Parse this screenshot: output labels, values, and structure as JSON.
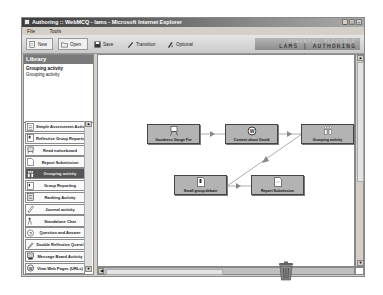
{
  "window": {
    "title": "Authoring :: WebMCQ - lams - Microsoft Internet Explorer",
    "controls": [
      "_",
      "□",
      "×"
    ]
  },
  "menu": {
    "items": [
      "File",
      "Tools"
    ]
  },
  "toolbar": {
    "new_label": "New",
    "open_label": "Open",
    "save_label": "Save",
    "transition_label": "Transition",
    "optional_label": "Optional",
    "brand_text": "LAMS | AUTHORING",
    "brand_ghost": "POWERFUL FLEXIBLE"
  },
  "library": {
    "title": "Library",
    "selected_title": "Grouping activity",
    "selected_desc": "Grouping activity",
    "items": [
      {
        "label": "Simple Assessment Activ",
        "icon": "list-doc-icon"
      },
      {
        "label": "Reflective Group Reports",
        "icon": "report-icon"
      },
      {
        "label": "Read noticeboard",
        "icon": "noticeboard-icon"
      },
      {
        "label": "Report Submission",
        "icon": "submission-icon"
      },
      {
        "label": "Grouping activity",
        "icon": "grouping-icon",
        "selected": true
      },
      {
        "label": "Group Reporting",
        "icon": "group-report-icon"
      },
      {
        "label": "Ranking Activity",
        "icon": "ranking-icon"
      },
      {
        "label": "Journal activity",
        "icon": "journal-icon"
      },
      {
        "label": "Standalone Chat",
        "icon": "chat-icon"
      },
      {
        "label": "Question and Answer",
        "icon": "question-icon"
      },
      {
        "label": "Double Reflective Questi",
        "icon": "pencil-icon"
      },
      {
        "label": "Message Board Activity",
        "icon": "message-board-icon"
      },
      {
        "label": "View Web Pages (URLs)",
        "icon": "web-icon"
      }
    ]
  },
  "canvas": {
    "nodes": [
      {
        "label": "Goodness Gauge For",
        "icon": "gauge-icon",
        "x": 49,
        "y": 69
      },
      {
        "label": "Content about Gould",
        "icon": "web-content-icon",
        "x": 127,
        "y": 69
      },
      {
        "label": "Grouping activity",
        "icon": "grouping-icon",
        "x": 203,
        "y": 69
      },
      {
        "label": "Small group debate",
        "icon": "debate-icon",
        "x": 76,
        "y": 120
      },
      {
        "label": "Report Submission",
        "icon": "submission-icon",
        "x": 153,
        "y": 120
      }
    ]
  },
  "trash": {
    "icon": "trash-icon"
  }
}
